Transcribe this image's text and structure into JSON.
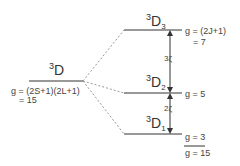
{
  "diagram": {
    "parent_term": {
      "multiplicity": "3",
      "letter": "D",
      "g_formula": "g = (2S+1)(2L+1)",
      "g_value": "= 15"
    },
    "levels": [
      {
        "multiplicity": "3",
        "letter": "D",
        "J": "3",
        "g_formula": "g = (2J+1)",
        "g_value": "= 7"
      },
      {
        "multiplicity": "3",
        "letter": "D",
        "J": "2",
        "g": "g = 5"
      },
      {
        "multiplicity": "3",
        "letter": "D",
        "J": "1",
        "g": "g = 3"
      }
    ],
    "gaps": [
      "3ζ",
      "2ζ"
    ],
    "total_g": "g = 15",
    "colors": {
      "line": "#333333",
      "dashed": "#999999"
    }
  }
}
